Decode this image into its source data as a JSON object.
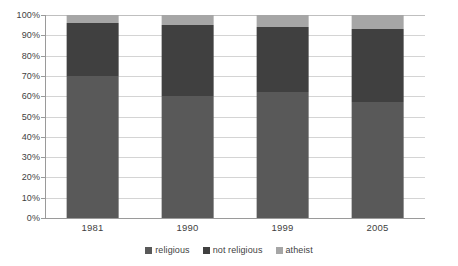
{
  "chart_data": {
    "type": "bar",
    "subtype": "100% stacked column",
    "title": "",
    "xlabel": "",
    "ylabel": "",
    "categories": [
      "1981",
      "1990",
      "1999",
      "2005"
    ],
    "series": [
      {
        "name": "religious",
        "color": "#595959",
        "values": [
          70,
          60,
          62,
          57
        ]
      },
      {
        "name": "not religious",
        "color": "#404040",
        "values": [
          26,
          35,
          32,
          36
        ]
      },
      {
        "name": "atheist",
        "color": "#a6a6a6",
        "values": [
          4,
          5,
          6,
          7
        ]
      }
    ],
    "ylim": [
      0,
      100
    ],
    "ytick_step": 10,
    "ytick_labels": [
      "0%",
      "10%",
      "20%",
      "30%",
      "40%",
      "50%",
      "60%",
      "70%",
      "80%",
      "90%",
      "100%"
    ],
    "grid": true,
    "grid_axis": "y",
    "legend_position": "bottom",
    "legend": [
      "religious",
      "not religious",
      "atheist"
    ]
  },
  "axis": {
    "y_labels": [
      "100%",
      "90%",
      "80%",
      "70%",
      "60%",
      "50%",
      "40%",
      "30%",
      "20%",
      "10%",
      "0%"
    ],
    "x_labels": [
      "1981",
      "1990",
      "1999",
      "2005"
    ]
  },
  "legend": {
    "items": [
      {
        "label": "religious",
        "color": "#595959"
      },
      {
        "label": "not religious",
        "color": "#404040"
      },
      {
        "label": "atheist",
        "color": "#a6a6a6"
      }
    ]
  },
  "colors": {
    "religious": "#595959",
    "not_religious": "#404040",
    "atheist": "#a6a6a6",
    "gridline": "#d4d4d4",
    "axis": "#9a9a9a",
    "text": "#3f3f3f",
    "background": "#ffffff"
  }
}
